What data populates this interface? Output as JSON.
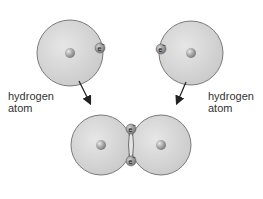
{
  "diagram": {
    "type": "covalent-bond-formation",
    "colors": {
      "atom_fill": "#d4d4d4",
      "atom_stroke": "#7a7a7a",
      "nucleus": "#a8a8a8",
      "electron": "#9a9a9a",
      "arrow": "#222222",
      "text": "#333333"
    },
    "labels": {
      "left_atom_line1": "hydrogen",
      "left_atom_line2": "atom",
      "right_atom_line1": "hydrogen",
      "right_atom_line2": "atom"
    },
    "electron_symbol": "e",
    "electron_charge": "−",
    "atoms": [
      {
        "name": "left-hydrogen-atom",
        "cx": 70,
        "cy": 53,
        "r": 33
      },
      {
        "name": "right-hydrogen-atom",
        "cx": 191,
        "cy": 53,
        "r": 32
      }
    ],
    "molecule": {
      "left": {
        "cx": 101,
        "cy": 145,
        "r": 30
      },
      "right": {
        "cx": 161,
        "cy": 145,
        "r": 30
      }
    }
  }
}
